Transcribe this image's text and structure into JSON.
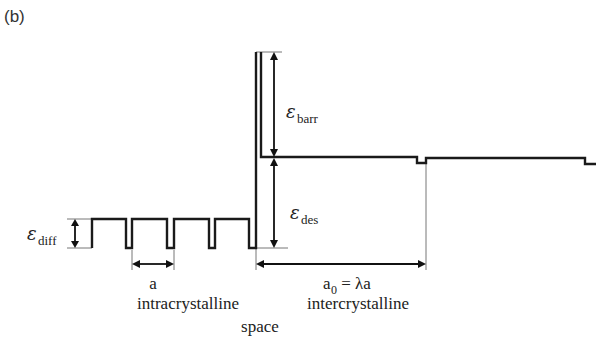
{
  "panel_label": "(b)",
  "labels": {
    "e_diff": {
      "symbol": "ε",
      "subscript": "diff"
    },
    "e_barr": {
      "symbol": "ε",
      "subscript": "barr"
    },
    "e_des": {
      "symbol": "ε",
      "subscript": "des"
    },
    "a": "a",
    "a0_main": "a",
    "a0_sub": "0",
    "a0_rest": " = λa",
    "intracrystalline": "intracrystalline",
    "space": "space",
    "intercrystalline": "intercrystalline"
  },
  "potential_profile": {
    "intracrystalline_wells": 4,
    "regions": [
      "intracrystalline",
      "intercrystalline"
    ]
  }
}
